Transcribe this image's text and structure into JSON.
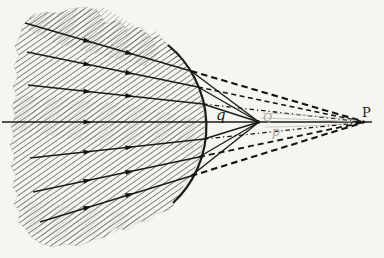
{
  "figure": {
    "labels": {
      "q": "q",
      "Q": "Q",
      "p": "p",
      "P": "P"
    },
    "colors": {
      "paper": "#f6f5f0",
      "ink": "#1c1b19",
      "hatch": "#403e39",
      "faint_label": "#a3a19a",
      "ghost_line": "#bdbbb2"
    }
  }
}
